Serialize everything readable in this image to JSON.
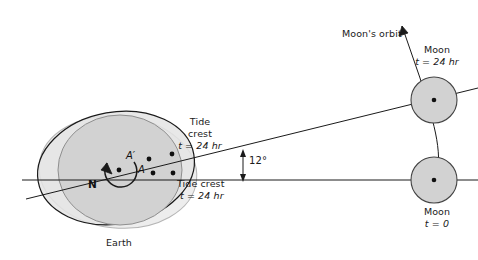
{
  "figure": {
    "background_color": "#ffffff",
    "width": 478,
    "height": 260
  },
  "colors": {
    "body_fill": "#d2d2d2",
    "bulge_fill": "#e2e2e2",
    "bulge_fill_light": "#ebebeb",
    "stroke_dark": "#1a1a1a",
    "stroke_light": "#9a9a9a",
    "text": "#1a1a1a"
  },
  "labels": {
    "earth": "Earth",
    "north_pole": "N",
    "point_a": "A",
    "point_a_prime": "A′",
    "moons_orbit": "Moon's orbit",
    "angle": "12°",
    "tide_crest_upper_line1": "Tide",
    "tide_crest_upper_line2": "crest",
    "tide_crest_upper_line3": "t = 24 hr",
    "tide_crest_lower_line1": "Tide crest",
    "tide_crest_lower_line2": "t = 24 hr",
    "moon_upper_line1": "Moon",
    "moon_upper_line2": "t = 24 hr",
    "moon_lower_line1": "Moon",
    "moon_lower_line2": "t = 0"
  },
  "diagram_data": {
    "type": "scientific-diagram",
    "earth": {
      "center_x": 118,
      "center_y": 170,
      "body_radius_x": 63,
      "body_radius_y": 55,
      "bulge_radius_x": 80,
      "bulge_radius_y": 57,
      "bulge_tilt_degrees": 12,
      "rotation_direction": "counterclockwise"
    },
    "moon_t0": {
      "center_x": 434,
      "center_y": 180,
      "radius": 23,
      "time_label": "t = 0"
    },
    "moon_t24": {
      "center_x": 434,
      "center_y": 100,
      "radius": 23,
      "time_label": "t = 24 hr"
    },
    "tidal_lag_angle_degrees": 12,
    "lines": [
      {
        "name": "earth-moon-t0-axis",
        "from": [
          20,
          180
        ],
        "to": [
          478,
          180
        ]
      },
      {
        "name": "earth-moon-t24-axis",
        "from": [
          24,
          198
        ],
        "to": [
          478,
          88
        ]
      },
      {
        "name": "moon-orbit-arc",
        "from": [
          434,
          180
        ],
        "to": [
          400,
          10
        ]
      }
    ],
    "marked_points": [
      {
        "name": "earth-center",
        "x": 118,
        "y": 170
      },
      {
        "name": "point-A",
        "x": 152,
        "y": 173
      },
      {
        "name": "point-A-prime",
        "x": 147,
        "y": 160
      },
      {
        "name": "tide-crest-upper-edge",
        "x": 172,
        "y": 155
      },
      {
        "name": "tide-crest-lower-edge",
        "x": 172,
        "y": 173
      },
      {
        "name": "moon-t0-center",
        "x": 434,
        "y": 180
      },
      {
        "name": "moon-t24-center",
        "x": 434,
        "y": 100
      }
    ]
  }
}
